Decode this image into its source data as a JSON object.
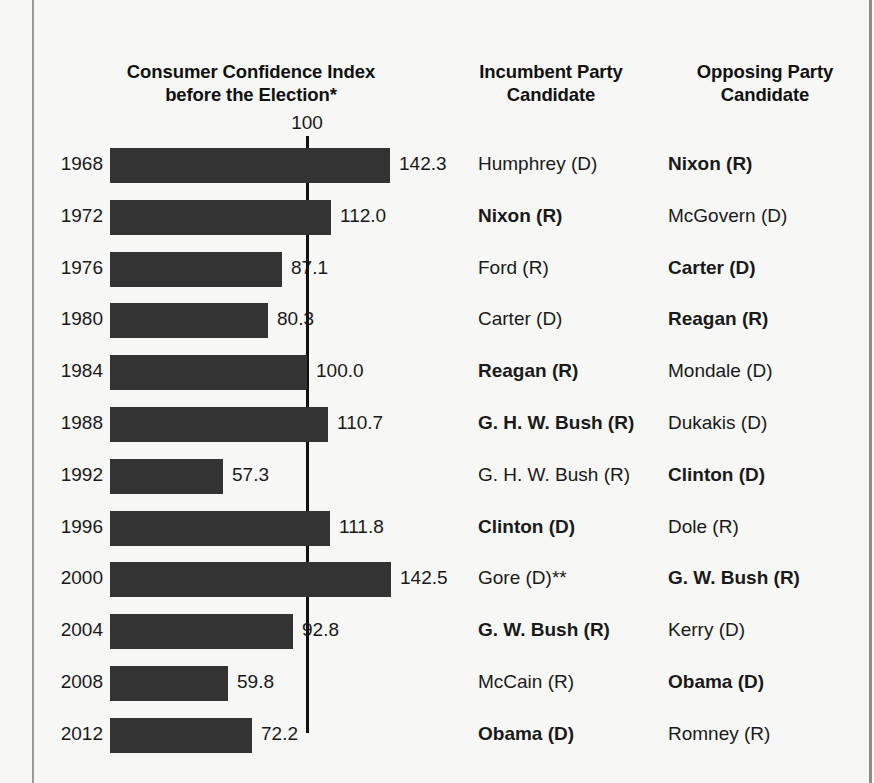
{
  "headers": {
    "chart": "Consumer Confidence Index before the Election*",
    "chart_line1": "Consumer Confidence Index",
    "chart_line2": "before the Election*",
    "incumbent_line1": "Incumbent Party",
    "incumbent_line2": "Candidate",
    "opposing_line1": "Opposing Party",
    "opposing_line2": "Candidate"
  },
  "reference": {
    "label": "100",
    "value": 100
  },
  "colors": {
    "bar": "#333333",
    "background": "#f7f7f5",
    "text": "#1a1a1a",
    "reference_line": "#111111"
  },
  "chart_data": {
    "type": "bar",
    "orientation": "horizontal",
    "title": "Consumer Confidence Index before the Election*",
    "xlabel": "",
    "ylabel": "",
    "xlim": [
      0,
      150
    ],
    "grid": false,
    "legend": null,
    "reference_line": 100,
    "categories": [
      "1968",
      "1972",
      "1976",
      "1980",
      "1984",
      "1988",
      "1992",
      "1996",
      "2000",
      "2004",
      "2008",
      "2012"
    ],
    "values": [
      142.3,
      112.0,
      87.1,
      80.3,
      100.0,
      110.7,
      57.3,
      111.8,
      142.5,
      92.8,
      59.8,
      72.2
    ],
    "value_labels": [
      "142.3",
      "112.0",
      "87.1",
      "80.3",
      "100.0",
      "110.7",
      "57.3",
      "111.8",
      "142.5",
      "92.8",
      "59.8",
      "72.2"
    ],
    "annotations": [
      "* Consumer Confidence Index before the Election",
      "** Gore (D)"
    ]
  },
  "rows": [
    {
      "year": "1968",
      "value": 142.3,
      "value_label": "142.3",
      "incumbent": "Humphrey (D)",
      "incumbent_winner": false,
      "opposing": "Nixon (R)",
      "opposing_winner": true
    },
    {
      "year": "1972",
      "value": 112.0,
      "value_label": "112.0",
      "incumbent": "Nixon (R)",
      "incumbent_winner": true,
      "opposing": "McGovern (D)",
      "opposing_winner": false
    },
    {
      "year": "1976",
      "value": 87.1,
      "value_label": "87.1",
      "incumbent": "Ford (R)",
      "incumbent_winner": false,
      "opposing": "Carter (D)",
      "opposing_winner": true
    },
    {
      "year": "1980",
      "value": 80.3,
      "value_label": "80.3",
      "incumbent": "Carter (D)",
      "incumbent_winner": false,
      "opposing": "Reagan (R)",
      "opposing_winner": true
    },
    {
      "year": "1984",
      "value": 100.0,
      "value_label": "100.0",
      "incumbent": "Reagan (R)",
      "incumbent_winner": true,
      "opposing": "Mondale (D)",
      "opposing_winner": false
    },
    {
      "year": "1988",
      "value": 110.7,
      "value_label": "110.7",
      "incumbent": "G. H. W. Bush (R)",
      "incumbent_winner": true,
      "opposing": "Dukakis (D)",
      "opposing_winner": false
    },
    {
      "year": "1992",
      "value": 57.3,
      "value_label": "57.3",
      "incumbent": "G. H. W. Bush (R)",
      "incumbent_winner": false,
      "opposing": "Clinton (D)",
      "opposing_winner": true
    },
    {
      "year": "1996",
      "value": 111.8,
      "value_label": "111.8",
      "incumbent": "Clinton (D)",
      "incumbent_winner": true,
      "opposing": "Dole (R)",
      "opposing_winner": false
    },
    {
      "year": "2000",
      "value": 142.5,
      "value_label": "142.5",
      "incumbent": "Gore (D)**",
      "incumbent_winner": false,
      "opposing": "G. W. Bush (R)",
      "opposing_winner": true
    },
    {
      "year": "2004",
      "value": 92.8,
      "value_label": "92.8",
      "incumbent": "G. W. Bush (R)",
      "incumbent_winner": true,
      "opposing": "Kerry (D)",
      "opposing_winner": false
    },
    {
      "year": "2008",
      "value": 59.8,
      "value_label": "59.8",
      "incumbent": "McCain (R)",
      "incumbent_winner": false,
      "opposing": "Obama (D)",
      "opposing_winner": true
    },
    {
      "year": "2012",
      "value": 72.2,
      "value_label": "72.2",
      "incumbent": "Obama (D)",
      "incumbent_winner": true,
      "opposing": "Romney (R)",
      "opposing_winner": false
    }
  ]
}
